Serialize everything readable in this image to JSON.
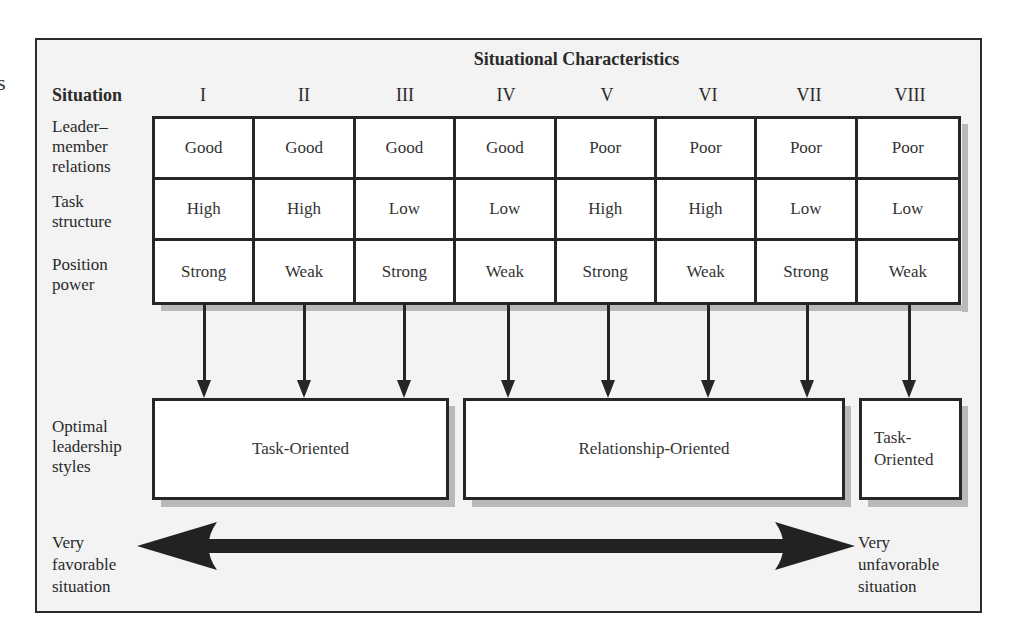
{
  "stray_glyph": "s",
  "header": {
    "title": "Situational Characteristics",
    "situation_label": "Situation",
    "situations": [
      "I",
      "II",
      "III",
      "IV",
      "V",
      "VI",
      "VII",
      "VIII"
    ]
  },
  "rows": [
    {
      "label_lines": [
        "Leader–",
        "member",
        "relations"
      ],
      "values": [
        "Good",
        "Good",
        "Good",
        "Good",
        "Poor",
        "Poor",
        "Poor",
        "Poor"
      ]
    },
    {
      "label_lines": [
        "Task",
        "structure"
      ],
      "values": [
        "High",
        "High",
        "Low",
        "Low",
        "High",
        "High",
        "Low",
        "Low"
      ]
    },
    {
      "label_lines": [
        "Position",
        "power"
      ],
      "values": [
        "Strong",
        "Weak",
        "Strong",
        "Weak",
        "Strong",
        "Weak",
        "Strong",
        "Weak"
      ]
    }
  ],
  "styles": {
    "label_lines": [
      "Optimal",
      "leadership",
      "styles"
    ],
    "boxes": [
      {
        "label": "Task-Oriented",
        "situations": [
          "I",
          "II",
          "III"
        ]
      },
      {
        "label": "Relationship-Oriented",
        "situations": [
          "IV",
          "V",
          "VI",
          "VII"
        ]
      },
      {
        "label_lines": [
          "Task-",
          "Oriented"
        ],
        "situations": [
          "VIII"
        ]
      }
    ]
  },
  "continuum": {
    "left_lines": [
      "Very",
      "favorable",
      "situation"
    ],
    "right_lines": [
      "Very",
      "unfavorable",
      "situation"
    ]
  },
  "colors": {
    "background": "#f3f3f3",
    "line": "#262626",
    "shadow": "#b9b9b9"
  }
}
